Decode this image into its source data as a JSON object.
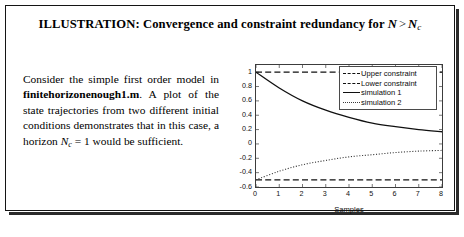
{
  "illustration": {
    "title_prefix": "ILLUSTRATION: Convergence and constraint redundancy for",
    "title_math": {
      "n": "N",
      "relation": ">",
      "n_sub": "N",
      "subscript": "c"
    },
    "body": {
      "part1": "Consider the simple first order model in ",
      "filename": "finitehorizonenough1.m",
      "part2": ". A plot of the state trajectories from two different initial conditions demonstrates that in this case, a horizon ",
      "horizon_var": "N",
      "horizon_sub": "c",
      "horizon_eq": "= 1",
      "part3": " would be sufficient."
    }
  },
  "chart_data": {
    "type": "line",
    "title": "",
    "xlabel": "Samples",
    "ylabel": "",
    "xlim": [
      0,
      8
    ],
    "ylim": [
      -0.6,
      1.1
    ],
    "grid": false,
    "legend_position": "top-right",
    "x_ticks": [
      "0",
      "1",
      "2",
      "3",
      "4",
      "5",
      "6",
      "7",
      "8"
    ],
    "y_ticks": [
      "1",
      "0.8",
      "0.6",
      "0.4",
      "0.2",
      "0",
      "-0.2",
      "-0.4",
      "-0.6"
    ],
    "x": [
      0,
      1,
      2,
      3,
      4,
      5,
      6,
      7,
      8
    ],
    "series": [
      {
        "name": "Upper constraint",
        "style": "dashed",
        "color": "#101010",
        "values": [
          1,
          1,
          1,
          1,
          1,
          1,
          1,
          1,
          1
        ]
      },
      {
        "name": "Lower constraint",
        "style": "dashed",
        "color": "#101010",
        "values": [
          -0.5,
          -0.5,
          -0.5,
          -0.5,
          -0.5,
          -0.5,
          -0.5,
          -0.5,
          -0.5
        ]
      },
      {
        "name": "simulation 1",
        "style": "solid",
        "color": "#101010",
        "values": [
          1.0,
          0.78,
          0.6,
          0.47,
          0.37,
          0.29,
          0.24,
          0.2,
          0.17
        ]
      },
      {
        "name": "simulation 2",
        "style": "dotted",
        "color": "#3a3a3a",
        "values": [
          -0.5,
          -0.38,
          -0.29,
          -0.23,
          -0.18,
          -0.15,
          -0.12,
          -0.1,
          -0.09
        ]
      }
    ]
  }
}
